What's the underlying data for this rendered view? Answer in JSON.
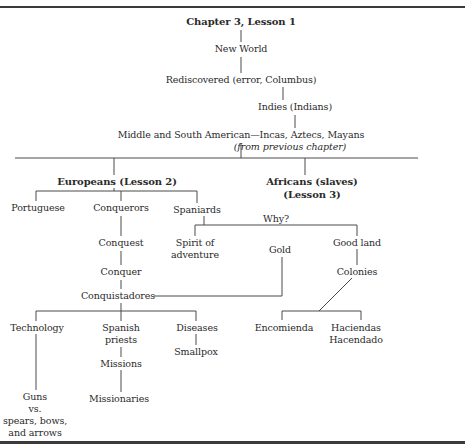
{
  "diagram": {
    "type": "concept-map",
    "root": {
      "id": "root",
      "label": "Chapter 3, Lesson 1"
    },
    "nodes": {
      "new_world": "New World",
      "rediscovered": "Rediscovered (error, Columbus)",
      "indies": "Indies (Indians)",
      "middle_south": "Middle and South American—Incas, Aztecs, Mayans",
      "from_previous": "(from previous chapter)",
      "europeans": "Europeans (Lesson 2)",
      "africans_1": "Africans (slaves)",
      "africans_2": "(Lesson 3)",
      "portuguese": "Portuguese",
      "conquerors": "Conquerors",
      "spaniards": "Spaniards",
      "why": "Why?",
      "spirit_1": "Spirit of",
      "spirit_2": "adventure",
      "gold": "Gold",
      "good_land": "Good land",
      "conquest": "Conquest",
      "conquer": "Conquer",
      "conquistadores": "Conquistadores",
      "colonies": "Colonies",
      "technology": "Technology",
      "spanish_priests_1": "Spanish",
      "spanish_priests_2": "priests",
      "diseases": "Diseases",
      "smallpox": "Smallpox",
      "encomienda": "Encomienda",
      "haciendas_1": "Haciendas",
      "haciendas_2": "Hacendado",
      "missions": "Missions",
      "missionaries": "Missionaries",
      "guns_1": "Guns",
      "guns_2": "vs.",
      "guns_3": "spears, bows,",
      "guns_4": "and arrows"
    },
    "edges": [
      [
        "Chapter 3, Lesson 1",
        "New World"
      ],
      [
        "New World",
        "Rediscovered (error, Columbus)"
      ],
      [
        "Rediscovered (error, Columbus)",
        "Indies (Indians)"
      ],
      [
        "Indies (Indians)",
        "Middle and South American—Incas, Aztecs, Mayans"
      ],
      [
        "Middle and South American—Incas, Aztecs, Mayans",
        "Europeans (Lesson 2)"
      ],
      [
        "Middle and South American—Incas, Aztecs, Mayans",
        "Africans (slaves) (Lesson 3)"
      ],
      [
        "Europeans (Lesson 2)",
        "Portuguese"
      ],
      [
        "Europeans (Lesson 2)",
        "Conquerors"
      ],
      [
        "Europeans (Lesson 2)",
        "Spaniards"
      ],
      [
        "Spaniards",
        "Spirit of adventure"
      ],
      [
        "Spaniards",
        "Good land"
      ],
      [
        "Conquerors",
        "Conquest"
      ],
      [
        "Conquest",
        "Conquer"
      ],
      [
        "Conquer",
        "Conquistadores"
      ],
      [
        "Gold",
        "Conquistadores"
      ],
      [
        "Good land",
        "Colonies"
      ],
      [
        "Colonies",
        "Encomienda"
      ],
      [
        "Colonies",
        "Haciendas Hacendado"
      ],
      [
        "Conquistadores",
        "Technology"
      ],
      [
        "Conquistadores",
        "Spanish priests"
      ],
      [
        "Conquistadores",
        "Diseases"
      ],
      [
        "Diseases",
        "Smallpox"
      ],
      [
        "Spanish priests",
        "Missions"
      ],
      [
        "Missions",
        "Missionaries"
      ],
      [
        "Technology",
        "Guns vs. spears, bows, and arrows"
      ]
    ]
  }
}
